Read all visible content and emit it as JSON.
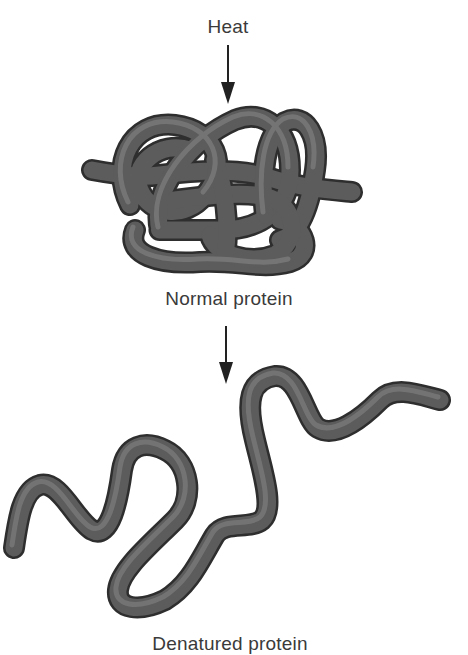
{
  "diagram": {
    "labels": {
      "heat": "Heat",
      "normal": "Normal protein",
      "denatured": "Denatured protein"
    },
    "colors": {
      "strand": "#5a5a5a",
      "strand_dark": "#2e2e2e",
      "strand_highlight": "#8a8a8a",
      "arrow": "#222222",
      "text": "#3a3a3a"
    },
    "flow": [
      "Heat",
      "Normal protein",
      "Denatured protein"
    ]
  }
}
